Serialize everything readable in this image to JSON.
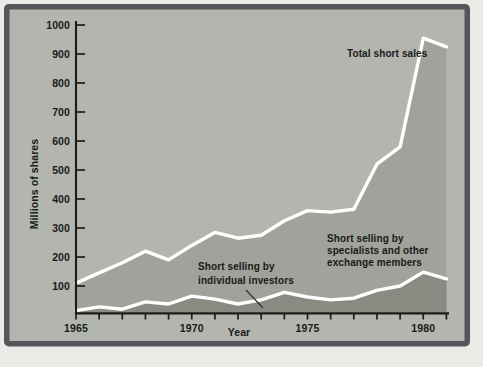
{
  "figure": {
    "margin_color": "#eaebe7",
    "border_color": "#55565a",
    "panel_color": "#b3b5af"
  },
  "chart_data": {
    "type": "area",
    "title": "",
    "xlabel": "Year",
    "ylabel": "Millions of shares",
    "ylim": [
      0,
      1000
    ],
    "yticks": [
      100,
      200,
      300,
      400,
      500,
      600,
      700,
      800,
      900,
      1000
    ],
    "x": [
      1965,
      1966,
      1967,
      1968,
      1969,
      1970,
      1971,
      1972,
      1973,
      1974,
      1975,
      1976,
      1977,
      1978,
      1979,
      1980,
      1981
    ],
    "xtick_labels": [
      1965,
      1970,
      1975,
      1980
    ],
    "series": [
      {
        "name": "Total short sales",
        "values": [
          110,
          145,
          180,
          220,
          190,
          240,
          285,
          265,
          275,
          325,
          360,
          355,
          365,
          520,
          580,
          955,
          925
        ]
      },
      {
        "name": "Short selling by specialists and other exchange members",
        "values": [
          15,
          28,
          20,
          45,
          38,
          65,
          55,
          38,
          52,
          78,
          62,
          52,
          58,
          85,
          100,
          148,
          125
        ]
      }
    ],
    "colors": {
      "area_between_lines": "#a0a29b",
      "area_bottom": "#8a8c84",
      "area_bottom_dots": "#767872",
      "line": "#ffffff",
      "axis": "#1c1c1a",
      "text": "#1a1a18"
    },
    "legend": "none (direct labels on chart)",
    "annotations": {
      "total": {
        "lines": [
          "Total short sales"
        ],
        "x": 347,
        "y": 57,
        "lh": 12
      },
      "individual": {
        "lines": [
          "Short selling by",
          "individual investors"
        ],
        "x": 198,
        "y": 270,
        "lh": 13.5,
        "callout": [
          246,
          290,
          263,
          308
        ]
      },
      "specialists": {
        "lines": [
          "Short selling by",
          "specialists and other",
          "exchange members"
        ],
        "x": 327,
        "y": 242,
        "lh": 12
      }
    }
  }
}
